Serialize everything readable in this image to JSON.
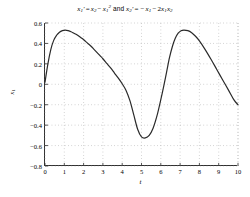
{
  "figure": {
    "background": "#ffffff",
    "axes_color": "#303030",
    "grid_color": "#9a9a9a",
    "curve_color": "#2a2a2a"
  },
  "title_parts": {
    "x1prime": "x",
    "sub1": "1",
    "prime": "'",
    "eq": "=",
    "x2": "x",
    "sub2": "2",
    "minus": "−",
    "x1sq_base": "x",
    "sub1b": "1",
    "sup2": "2",
    "and": "and",
    "x2prime": "x",
    "sub2b": "2",
    "prime2": "'",
    "eq2": "=",
    "neg": "−",
    "x1c": "x",
    "sub1c": "1",
    "minus2": "−",
    "two": "2",
    "x1d": "x",
    "sub1d": "1",
    "x2c": "x",
    "sub2c": "2"
  },
  "title_text": "x1' = x2 - x1^2 and x2' = -x1 - 2x1x2",
  "axes": {
    "xlabel": "t",
    "ylabel_base": "x",
    "ylabel_sub": "1",
    "ylabel_text": "x1",
    "xticks": [
      "0",
      "1",
      "2",
      "3",
      "4",
      "5",
      "6",
      "7",
      "8",
      "9",
      "10"
    ],
    "yticks": [
      "0.6",
      "0.4",
      "0.2",
      "0",
      "-0.2",
      "-0.4",
      "-0.6",
      "-0.8"
    ],
    "xlim": [
      0,
      10
    ],
    "ylim": [
      -0.8,
      0.6
    ],
    "grid": true,
    "grid_style": "dotted"
  },
  "chart_data": {
    "type": "line",
    "xlabel": "t",
    "ylabel": "x1",
    "xlim": [
      0,
      10
    ],
    "ylim": [
      -0.8,
      0.6
    ],
    "grid": true,
    "legend": null,
    "series": [
      {
        "name": "x1(t)",
        "color": "#2a2a2a",
        "linewidth": 1.2,
        "x": [
          0.0,
          0.15,
          0.3,
          0.45,
          0.6,
          0.75,
          0.9,
          1.05,
          1.2,
          1.35,
          1.5,
          1.65,
          1.8,
          1.95,
          2.1,
          2.25,
          2.4,
          2.55,
          2.7,
          2.85,
          3.0,
          3.2,
          3.4,
          3.6,
          3.8,
          4.0,
          4.2,
          4.4,
          4.6,
          4.8,
          5.0,
          5.2,
          5.4,
          5.6,
          5.8,
          6.0,
          6.15,
          6.3,
          6.45,
          6.6,
          6.75,
          6.9,
          7.05,
          7.2,
          7.4,
          7.6,
          7.8,
          8.0,
          8.3,
          8.6,
          8.9,
          9.2,
          9.5,
          9.8,
          10.0
        ],
        "y": [
          0.02,
          0.2,
          0.34,
          0.43,
          0.48,
          0.51,
          0.525,
          0.53,
          0.525,
          0.515,
          0.5,
          0.485,
          0.465,
          0.445,
          0.42,
          0.395,
          0.37,
          0.34,
          0.31,
          0.28,
          0.25,
          0.205,
          0.16,
          0.11,
          0.06,
          0.005,
          -0.06,
          -0.16,
          -0.3,
          -0.44,
          -0.515,
          -0.525,
          -0.5,
          -0.43,
          -0.31,
          -0.15,
          -0.02,
          0.12,
          0.26,
          0.37,
          0.45,
          0.5,
          0.525,
          0.53,
          0.525,
          0.505,
          0.47,
          0.425,
          0.34,
          0.245,
          0.145,
          0.045,
          -0.055,
          -0.155,
          -0.2
        ]
      }
    ]
  }
}
